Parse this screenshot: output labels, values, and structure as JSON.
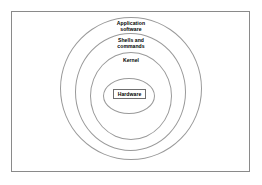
{
  "figure": {
    "background_color": "#ffffff",
    "frame_color": "#8a8a8a",
    "ring_color": "#9a9a9a",
    "text_color": "#000000"
  },
  "layers": [
    {
      "id": "application",
      "label": "Application\nsoftware",
      "level": 1,
      "position": "outermost"
    },
    {
      "id": "shells",
      "label": "Shells and\ncommands",
      "level": 2,
      "position": "second"
    },
    {
      "id": "kernel",
      "label": "Kernel",
      "level": 3,
      "position": "third"
    },
    {
      "id": "hardware",
      "label": "Hardware",
      "level": 4,
      "position": "innermost"
    }
  ]
}
